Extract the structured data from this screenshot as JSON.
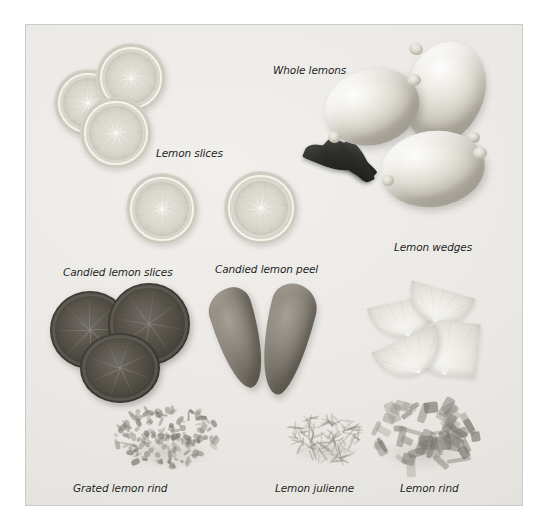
{
  "figure": {
    "kind": "photographic-plate",
    "background_color": "#ffffff",
    "plate_color": "#efedea",
    "border_color": "#c9c9c6"
  },
  "labels": [
    {
      "id": "whole-lemons",
      "text": "Whole lemons",
      "x": 272,
      "y": 63
    },
    {
      "id": "lemon-slices",
      "text": "Lemon slices",
      "x": 155,
      "y": 146
    },
    {
      "id": "lemon-wedges",
      "text": "Lemon wedges",
      "x": 393,
      "y": 240
    },
    {
      "id": "candied-lemon-slices",
      "text": "Candied lemon slices",
      "x": 62,
      "y": 265
    },
    {
      "id": "candied-lemon-peel",
      "text": "Candied lemon peel",
      "x": 214,
      "y": 262
    },
    {
      "id": "grated-lemon-rind",
      "text": "Grated lemon rind",
      "x": 72,
      "y": 481
    },
    {
      "id": "lemon-julienne",
      "text": "Lemon julienne",
      "x": 274,
      "y": 481
    },
    {
      "id": "lemon-rind",
      "text": "Lemon rind",
      "x": 399,
      "y": 481
    }
  ],
  "specimens": [
    {
      "id": "lemon-slices-group",
      "label": "Lemon slices",
      "count": 3,
      "note": "overlapping round slices, top left"
    },
    {
      "id": "lemon-slices-pair",
      "label": "Lemon slices",
      "count": 2,
      "note": "two separate round slices, centre left"
    },
    {
      "id": "whole-lemons-group",
      "label": "Whole lemons",
      "count": 3,
      "note": "three whole lemons with dark leaves"
    },
    {
      "id": "candied-lemon-slices-group",
      "label": "Candied lemon slices",
      "count": 3,
      "note": "dark translucent candied rounds"
    },
    {
      "id": "candied-lemon-peel-group",
      "label": "Candied lemon peel",
      "count": 2,
      "note": "two pointed candied peel pieces"
    },
    {
      "id": "lemon-wedges-group",
      "label": "Lemon wedges",
      "count": 4,
      "note": "half-moon wedges"
    },
    {
      "id": "grated-lemon-rind-pile",
      "label": "Grated lemon rind",
      "count": 1,
      "note": "fine fluffy pile"
    },
    {
      "id": "lemon-julienne-pile",
      "label": "Lemon julienne",
      "count": 1,
      "note": "fine thread pile"
    },
    {
      "id": "lemon-rind-pile",
      "label": "Lemon rind",
      "count": 1,
      "note": "coarse strip pile"
    }
  ]
}
